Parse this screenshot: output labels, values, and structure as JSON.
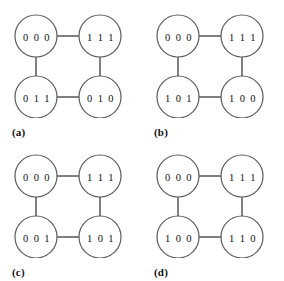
{
  "figure": {
    "type": "graph-diagram",
    "panel_count": 4,
    "node_radius": 21,
    "stroke_color": "#4a4a4a",
    "node_fill": "#ffffff",
    "background": "#ffffff",
    "panels": [
      {
        "id": "a",
        "caption": "(a)",
        "nodes": {
          "top_left": "0 0 0",
          "top_right": "1 1 1",
          "bottom_left": "0 1 1",
          "bottom_right": "0 1 0"
        },
        "edges": [
          "top_left-top_right",
          "top_left-bottom_left",
          "top_right-bottom_right",
          "bottom_left-bottom_right"
        ]
      },
      {
        "id": "b",
        "caption": "(b)",
        "nodes": {
          "top_left": "0 0 0",
          "top_right": "1 1 1",
          "bottom_left": "1 0 1",
          "bottom_right": "1 0 0"
        },
        "edges": [
          "top_left-top_right",
          "top_left-bottom_left",
          "top_right-bottom_right",
          "bottom_left-bottom_right"
        ]
      },
      {
        "id": "c",
        "caption": "(c)",
        "nodes": {
          "top_left": "0 0 0",
          "top_right": "1 1 1",
          "bottom_left": "0 0 1",
          "bottom_right": "1 0 1"
        },
        "edges": [
          "top_left-top_right",
          "top_left-bottom_left",
          "top_right-bottom_right",
          "bottom_left-bottom_right"
        ]
      },
      {
        "id": "d",
        "caption": "(d)",
        "nodes": {
          "top_left": "0 0 0",
          "top_right": "1 1 1",
          "bottom_left": "1 0 0",
          "bottom_right": "1 1 0"
        },
        "edges": [
          "top_left-top_right",
          "top_left-bottom_left",
          "top_right-bottom_right",
          "bottom_left-bottom_right"
        ]
      }
    ]
  }
}
